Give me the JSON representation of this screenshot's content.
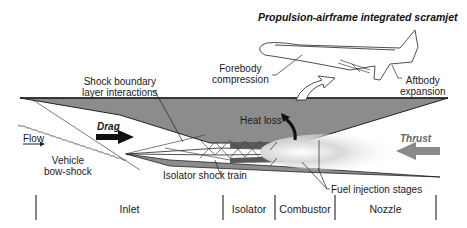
{
  "title": "Propulsion-airframe integrated scramjet",
  "labels": {
    "forebody": [
      "Forebody",
      "compression"
    ],
    "aftbody": [
      "Aftbody",
      "expansion"
    ],
    "shock_boundary": [
      "Shock boundary",
      "layer interactions"
    ],
    "heat_loss": "Heat loss",
    "drag": "Drag",
    "thrust": "Thrust",
    "flow": "Flow",
    "bow_shock": [
      "Vehicle",
      "bow-shock"
    ],
    "isolator_shock_train": "Isolator shock train",
    "fuel_injection": "Fuel injection stages"
  },
  "sections": [
    {
      "label": "Inlet"
    },
    {
      "label": "Isolator"
    },
    {
      "label": "Combustor"
    },
    {
      "label": "Nozzle"
    }
  ],
  "colors": {
    "body_fill": "#8c8c8c",
    "dark_fill": "#5a5a5a",
    "line": "#222222",
    "thrust_arrow": "#8a8a8a"
  }
}
